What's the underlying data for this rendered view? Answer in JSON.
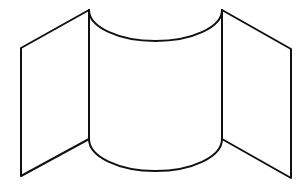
{
  "figure": {
    "colors": {
      "background": "#ffffff",
      "stroke": "#111111"
    },
    "shapes": {
      "left_panel": {
        "points": [
          [
            21,
            48
          ],
          [
            89,
            10
          ],
          [
            89,
            139
          ],
          [
            21,
            176
          ]
        ]
      },
      "center_panel": {
        "top_left": [
          89,
          10
        ],
        "top_right": [
          222,
          10
        ],
        "bottom_left": [
          89,
          139
        ],
        "bottom_right": [
          222,
          139
        ],
        "arc_rx": 66.5,
        "arc_ry": 31
      },
      "right_panel": {
        "points": [
          [
            222,
            10
          ],
          [
            291,
            49
          ],
          [
            291,
            178
          ],
          [
            222,
            139
          ]
        ]
      }
    }
  }
}
